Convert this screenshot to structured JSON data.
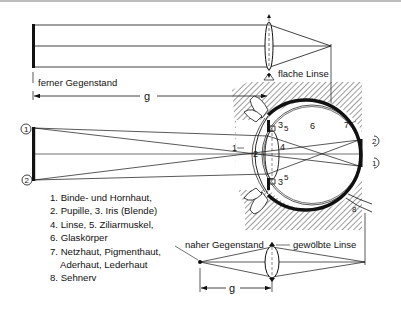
{
  "diagram": {
    "title_labels": {
      "far_object": "ferner Gegenstand",
      "flat_lens": "flache Linse",
      "near_object": "naher Gegenstand",
      "curved_lens": "gewölbte Linse",
      "distance_far": "g",
      "distance_near": "g"
    },
    "object_markers": {
      "top": "1",
      "bottom": "2"
    },
    "retina_markers": {
      "top": "2",
      "bottom": "1"
    },
    "eye_numbers": {
      "n1": "1",
      "n2": "2",
      "n3_top": "3",
      "n5_top": "5",
      "n4": "4",
      "n3_bottom": "3",
      "n5_bottom": "5",
      "n6": "6",
      "n7": "7",
      "n8": "8"
    },
    "legend": [
      "1. Binde- und Hornhaut,",
      "2. Pupille, 3. Iris (Blende)",
      "4. Linse, 5. Ziliarmuskel,",
      "6. Glaskörper",
      "7. Netzhaut, Pigmenthaut,",
      "Aderhaut, Lederhaut",
      "8. Sehnerv"
    ],
    "colors": {
      "ink": "#111111",
      "background": "#ffffff",
      "frame": "#bdbdbd"
    }
  }
}
